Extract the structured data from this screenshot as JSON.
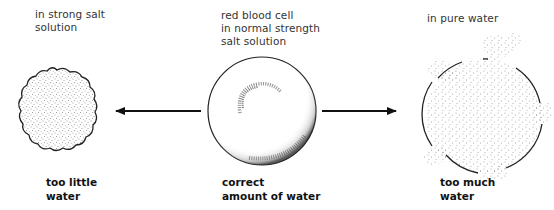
{
  "diagram": {
    "type": "osmosis-red-blood-cell",
    "cells": [
      {
        "id": "hypertonic",
        "condition_lines": [
          "in strong salt",
          "solution"
        ],
        "result_lines": [
          "too little",
          "water"
        ],
        "shape": "shrunken-crenated"
      },
      {
        "id": "isotonic",
        "condition_lines": [
          "red blood cell",
          "in normal strength",
          "salt solution"
        ],
        "result_lines": [
          "correct",
          "amount of water"
        ],
        "shape": "normal-biconcave"
      },
      {
        "id": "hypotonic",
        "condition_lines": [
          "in pure water"
        ],
        "result_lines": [
          "too much",
          "water"
        ],
        "shape": "swollen-bursting"
      }
    ],
    "arrows": [
      {
        "from": "isotonic",
        "to": "hypertonic",
        "direction": "left"
      },
      {
        "from": "isotonic",
        "to": "hypotonic",
        "direction": "right"
      }
    ],
    "colors": {
      "stroke": "#222222",
      "stipple": "#555555",
      "background": "#ffffff"
    }
  }
}
